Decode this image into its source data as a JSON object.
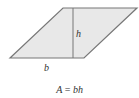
{
  "figure": {
    "shape": "parallelogram",
    "fill_color": "#e8e8e8",
    "stroke_color": "#777777",
    "labels": {
      "height": "h",
      "base": "b"
    },
    "formula": {
      "lhs": "A",
      "equals": "=",
      "rhs": "bh",
      "text": "A = bh"
    }
  }
}
